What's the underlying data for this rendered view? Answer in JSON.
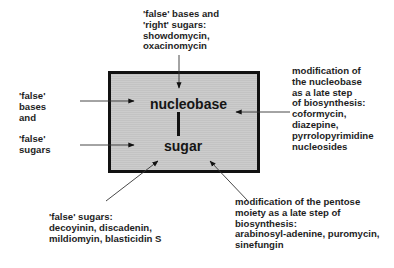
{
  "diagram": {
    "center_box": {
      "top_label": "nucleobase",
      "bottom_label": "sugar",
      "fill_color": "#c9c9c9",
      "border_color": "#111111"
    },
    "annotations": {
      "top": "'false' bases and\n'right' sugars:\nshowdomycin,\noxacinomycin",
      "left_bases": "'false'\nbases\nand",
      "left_sugars": "'false'\nsugars",
      "right": "modification of\nthe nucleobase\nas a late step\nof biosynthesis:\ncoformycin,\ndiazepine,\npyrrolopyrimidine\nnucleosides",
      "bottom_left": "'false' sugars:\ndecoyinin, discadenin,\nmildiomyin, blasticidin S",
      "bottom_right": "modification of the pentose\nmoiety as a late step of\nbiosynthesis:\narabinosyl-adenine, puromycin,\nsinefungin"
    },
    "arrows": [
      {
        "from": "top",
        "x1": 179,
        "y1": 55,
        "x2": 179,
        "y2": 88
      },
      {
        "from": "left_bases",
        "x1": 80,
        "y1": 101,
        "x2": 134,
        "y2": 101
      },
      {
        "from": "left_sugars",
        "x1": 80,
        "y1": 145,
        "x2": 134,
        "y2": 145
      },
      {
        "from": "right",
        "x1": 290,
        "y1": 112,
        "x2": 236,
        "y2": 112
      },
      {
        "from": "bottom_left",
        "x1": 106,
        "y1": 201,
        "x2": 158,
        "y2": 161
      },
      {
        "from": "bottom_right",
        "x1": 248,
        "y1": 201,
        "x2": 210,
        "y2": 161
      }
    ]
  }
}
